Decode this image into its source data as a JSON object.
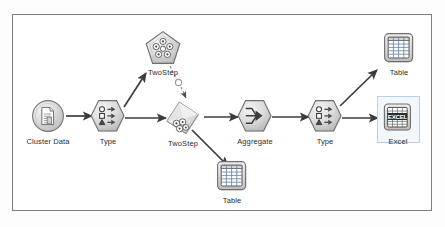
{
  "canvas": {
    "background": "#fdfdfd",
    "border_color": "#7d7d7d",
    "surface": "#ffffff"
  },
  "palette": {
    "node_fill_light": "#e8e8e8",
    "node_fill_mid": "#c9c9c9",
    "node_stroke": "#6f6f6f",
    "link_color": "#3c3c3c",
    "label_color": "#2b2b2b",
    "selection_border": "#b9cfe4",
    "selection_fill": "#f2f7fc",
    "table_grid_blue": "#5d7fa6",
    "excel_text": "#1f1f1f"
  },
  "stream": {
    "title": "Cluster Data Stream",
    "nodes": [
      {
        "id": "cluster-data",
        "label": "Cluster Data",
        "type": "source",
        "icon": "document-source-icon",
        "shape": "circle",
        "x": 48,
        "y": 116
      },
      {
        "id": "type-1",
        "label": "Type",
        "type": "field-op",
        "icon": "type-icon",
        "shape": "hexagon",
        "x": 108,
        "y": 116
      },
      {
        "id": "twostep-nugget",
        "label": "TwoStep",
        "type": "model-nugget",
        "icon": "cluster-nugget-icon",
        "shape": "pentagon",
        "x": 163,
        "y": 48
      },
      {
        "id": "twostep-model",
        "label": "TwoStep",
        "type": "modeling",
        "icon": "cluster-diamond-icon",
        "shape": "diamond",
        "x": 183,
        "y": 118
      },
      {
        "id": "aggregate",
        "label": "Aggregate",
        "type": "record-op",
        "icon": "aggregate-icon",
        "shape": "hexagon",
        "x": 255,
        "y": 116
      },
      {
        "id": "type-2",
        "label": "Type",
        "type": "field-op",
        "icon": "type-icon",
        "shape": "hexagon",
        "x": 325,
        "y": 116
      },
      {
        "id": "table-top",
        "label": "Table",
        "type": "output",
        "icon": "table-grid-icon",
        "shape": "rounded-square",
        "x": 399,
        "y": 48
      },
      {
        "id": "excel",
        "label": "Excel",
        "type": "export",
        "icon": "excel-icon",
        "shape": "rounded-square",
        "x": 398,
        "y": 118,
        "selected": true
      },
      {
        "id": "table-bottom",
        "label": "Table",
        "type": "output",
        "icon": "table-grid-icon",
        "shape": "rounded-square",
        "x": 232,
        "y": 176
      }
    ],
    "links": [
      {
        "from": "cluster-data",
        "to": "type-1",
        "style": "solid"
      },
      {
        "from": "type-1",
        "to": "twostep-nugget",
        "style": "solid"
      },
      {
        "from": "type-1",
        "to": "twostep-model",
        "style": "solid"
      },
      {
        "from": "twostep-nugget",
        "to": "twostep-model",
        "style": "dashed"
      },
      {
        "from": "twostep-model",
        "to": "aggregate",
        "style": "solid"
      },
      {
        "from": "twostep-model",
        "to": "table-bottom",
        "style": "solid"
      },
      {
        "from": "aggregate",
        "to": "type-2",
        "style": "solid"
      },
      {
        "from": "type-2",
        "to": "table-top",
        "style": "solid"
      },
      {
        "from": "type-2",
        "to": "excel",
        "style": "solid"
      }
    ]
  }
}
